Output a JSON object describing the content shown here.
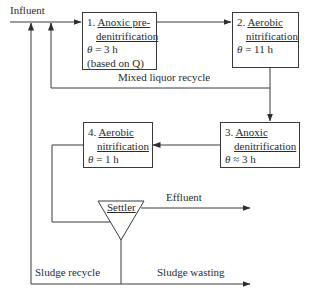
{
  "diagram": {
    "type": "process-flow",
    "title": "",
    "colors": {
      "line": "#3a3a3a",
      "text": "#2b2b2b",
      "background": "#ffffff"
    },
    "labels": {
      "influent": "Influent",
      "mixed_liquor_recycle": "Mixed liquor recycle",
      "effluent": "Effluent",
      "sludge_recycle": "Sludge recycle",
      "sludge_wasting": "Sludge wasting"
    },
    "units": [
      {
        "number": "1.",
        "name_line1": "Anoxic pre-",
        "name_line2": "denitrification",
        "theta_symbol": "θ",
        "theta_value": "= 3 h",
        "note": "(based on Q)"
      },
      {
        "number": "2.",
        "name_line1": "Aerobic",
        "name_line2": "nitrification",
        "theta_symbol": "θ",
        "theta_value": "= 11 h"
      },
      {
        "number": "3.",
        "name_line1": "Anoxic",
        "name_line2": "denitrification",
        "theta_symbol": "θ",
        "theta_value": "≈ 3 h"
      },
      {
        "number": "4.",
        "name_line1": "Aerobic",
        "name_line2": "nitrification",
        "theta_symbol": "θ",
        "theta_value": "= 1 h"
      }
    ],
    "settler": {
      "label": "Settler"
    },
    "connections": [
      {
        "from": "Influent",
        "to": "1"
      },
      {
        "from": "1",
        "to": "2"
      },
      {
        "from": "2",
        "to": "1",
        "label": "Mixed liquor recycle"
      },
      {
        "from": "2",
        "to": "3"
      },
      {
        "from": "3",
        "to": "4"
      },
      {
        "from": "4",
        "to": "Settler"
      },
      {
        "from": "Settler",
        "to": "Effluent"
      },
      {
        "from": "Settler",
        "to": "1",
        "label": "Sludge recycle"
      },
      {
        "from": "Settler",
        "to": "Sludge wasting"
      }
    ]
  }
}
